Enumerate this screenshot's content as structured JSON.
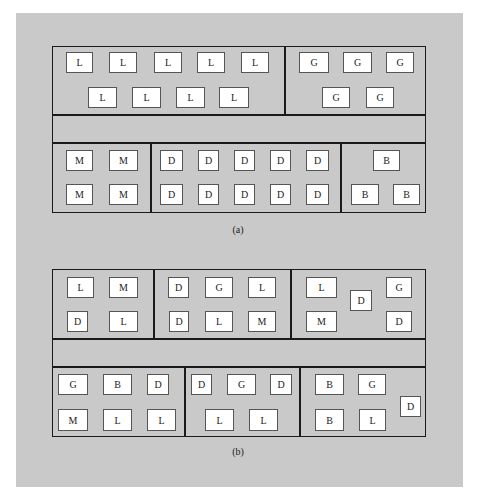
{
  "diagrams": [
    {
      "id": "a",
      "caption": "(a)",
      "caption_pos": [
        238,
        224
      ],
      "frame": [
        52,
        46,
        374,
        167
      ],
      "lines": [
        {
          "x": 52,
          "y": 114,
          "w": 374,
          "h": 1.5
        },
        {
          "x": 52,
          "y": 142,
          "w": 374,
          "h": 1.5
        },
        {
          "x": 284,
          "y": 46,
          "w": 1.5,
          "h": 68
        },
        {
          "x": 150,
          "y": 142,
          "w": 1.5,
          "h": 71
        },
        {
          "x": 340,
          "y": 142,
          "w": 1.5,
          "h": 71
        }
      ],
      "departments": [
        {
          "name": "L",
          "boxes": [
            [
              66,
              52,
              27,
              21
            ],
            [
              109,
              52,
              28,
              21
            ],
            [
              154,
              52,
              28,
              21
            ],
            [
              197,
              52,
              28,
              21
            ],
            [
              241,
              52,
              28,
              21
            ],
            [
              88,
              87,
              29,
              21
            ],
            [
              132,
              87,
              29,
              21
            ],
            [
              176,
              87,
              29,
              21
            ],
            [
              219,
              87,
              30,
              21
            ]
          ]
        },
        {
          "name": "G",
          "boxes": [
            [
              299,
              52,
              30,
              21
            ],
            [
              343,
              52,
              29,
              21
            ],
            [
              386,
              52,
              28,
              21
            ],
            [
              322,
              87,
              28,
              21
            ],
            [
              366,
              87,
              28,
              21
            ]
          ]
        },
        {
          "name": "M",
          "boxes": [
            [
              66,
              150,
              27,
              21
            ],
            [
              109,
              150,
              29,
              21
            ],
            [
              66,
              184,
              27,
              21
            ],
            [
              109,
              184,
              29,
              21
            ]
          ]
        },
        {
          "name": "D",
          "boxes": [
            [
              160,
              150,
              23,
              21
            ],
            [
              198,
              150,
              21,
              21
            ],
            [
              234,
              150,
              21,
              21
            ],
            [
              270,
              150,
              21,
              21
            ],
            [
              306,
              150,
              23,
              21
            ],
            [
              160,
              184,
              23,
              21
            ],
            [
              198,
              184,
              21,
              21
            ],
            [
              234,
              184,
              21,
              21
            ],
            [
              270,
              184,
              21,
              21
            ],
            [
              306,
              184,
              23,
              21
            ]
          ]
        },
        {
          "name": "B",
          "boxes": [
            [
              373,
              150,
              27,
              21
            ],
            [
              351,
              184,
              28,
              21
            ],
            [
              393,
              184,
              27,
              21
            ]
          ]
        }
      ]
    },
    {
      "id": "b",
      "caption": "(b)",
      "caption_pos": [
        238,
        446
      ],
      "frame": [
        52,
        269,
        374,
        168
      ],
      "lines": [
        {
          "x": 52,
          "y": 338,
          "w": 374,
          "h": 1.5
        },
        {
          "x": 52,
          "y": 366,
          "w": 374,
          "h": 1.5
        },
        {
          "x": 153,
          "y": 269,
          "w": 1.5,
          "h": 69
        },
        {
          "x": 290,
          "y": 269,
          "w": 1.5,
          "h": 69
        },
        {
          "x": 184,
          "y": 366,
          "w": 1.5,
          "h": 71
        },
        {
          "x": 299,
          "y": 366,
          "w": 1.5,
          "h": 71
        }
      ],
      "cells": [
        {
          "boxes": [
            [
              "L",
              67,
              277,
              27,
              21
            ],
            [
              "M",
              109,
              277,
              29,
              21
            ],
            [
              "D",
              67,
              311,
              21,
              21
            ],
            [
              "L",
              109,
              311,
              29,
              21
            ]
          ]
        },
        {
          "boxes": [
            [
              "D",
              168,
              277,
              21,
              21
            ],
            [
              "G",
              205,
              277,
              28,
              21
            ],
            [
              "L",
              248,
              277,
              28,
              21
            ],
            [
              "D",
              169,
              311,
              20,
              21
            ],
            [
              "L",
              205,
              311,
              28,
              21
            ],
            [
              "M",
              248,
              311,
              28,
              21
            ]
          ]
        },
        {
          "boxes": [
            [
              "L",
              306,
              277,
              31,
              21
            ],
            [
              "D",
              350,
              290,
              22,
              21
            ],
            [
              "G",
              386,
              277,
              26,
              21
            ],
            [
              "M",
              306,
              311,
              31,
              21
            ],
            [
              "D",
              386,
              311,
              26,
              21
            ]
          ]
        },
        {
          "boxes": [
            [
              "G",
              58,
              374,
              30,
              21
            ],
            [
              "B",
              103,
              374,
              29,
              21
            ],
            [
              "D",
              147,
              374,
              22,
              21
            ],
            [
              "M",
              58,
              409,
              30,
              22
            ],
            [
              "L",
              103,
              409,
              29,
              22
            ],
            [
              "L",
              147,
              409,
              29,
              22
            ]
          ]
        },
        {
          "boxes": [
            [
              "D",
              191,
              374,
              21,
              21
            ],
            [
              "G",
              227,
              374,
              29,
              21
            ],
            [
              "D",
              270,
              374,
              22,
              21
            ],
            [
              "L",
              205,
              409,
              29,
              22
            ],
            [
              "L",
              249,
              409,
              29,
              22
            ]
          ]
        },
        {
          "boxes": [
            [
              "B",
              315,
              374,
              29,
              21
            ],
            [
              "G",
              358,
              374,
              28,
              21
            ],
            [
              "D",
              400,
              396,
              21,
              21
            ],
            [
              "B",
              315,
              409,
              29,
              22
            ],
            [
              "L",
              359,
              409,
              27,
              22
            ]
          ]
        }
      ]
    }
  ],
  "colors": {
    "panel": "#c9c9c9",
    "line": "#1a1a1a",
    "box": "#ffffff"
  }
}
